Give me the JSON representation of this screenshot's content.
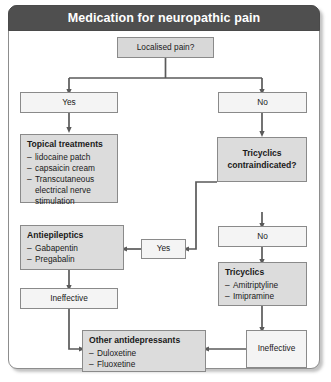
{
  "header": {
    "title": "Medication for neuropathic pain"
  },
  "colors": {
    "header_bg": "#4f4f4f",
    "header_text": "#ffffff",
    "node_shaded": "#dcdcdc",
    "node_plain": "#f4f4f4",
    "border": "#8a8a8a",
    "connector": "#5a5a5a"
  },
  "diagram": {
    "type": "flowchart",
    "nodes": [
      {
        "id": "localised_pain",
        "label": "Localised pain?",
        "kind": "decision"
      },
      {
        "id": "yes_left",
        "label": "Yes",
        "kind": "plain"
      },
      {
        "id": "no_right",
        "label": "No",
        "kind": "plain"
      },
      {
        "id": "topical",
        "label": "Topical treatments",
        "kind": "list",
        "items": [
          "lidocaine patch",
          "capsaicin cream",
          "Transcutaneous\nelectrical nerve\nstimulation"
        ]
      },
      {
        "id": "tricyclics_ci",
        "label": "Tricyclics\ncontraindicated?",
        "kind": "shaded"
      },
      {
        "id": "yes_mid",
        "label": "Yes",
        "kind": "plain"
      },
      {
        "id": "no_mid",
        "label": "No",
        "kind": "plain"
      },
      {
        "id": "antiepileptics",
        "label": "Antiepileptics",
        "kind": "list",
        "items": [
          "Gabapentin",
          "Pregabalin"
        ]
      },
      {
        "id": "tricyclics",
        "label": "Tricyclics",
        "kind": "list",
        "items": [
          "Amitriptyline",
          "Imipramine"
        ]
      },
      {
        "id": "ineffective_left",
        "label": "Ineffective",
        "kind": "plain"
      },
      {
        "id": "ineffective_right",
        "label": "Ineffective",
        "kind": "plain"
      },
      {
        "id": "other_antidep",
        "label": "Other antidepressants",
        "kind": "list",
        "items": [
          "Duloxetine",
          "Fluoxetine"
        ]
      }
    ],
    "edges": [
      {
        "from": "localised_pain",
        "to": "yes_left"
      },
      {
        "from": "localised_pain",
        "to": "no_right"
      },
      {
        "from": "yes_left",
        "to": "topical"
      },
      {
        "from": "no_right",
        "to": "tricyclics_ci"
      },
      {
        "from": "tricyclics_ci",
        "to": "yes_mid"
      },
      {
        "from": "tricyclics_ci",
        "to": "no_mid"
      },
      {
        "from": "yes_mid",
        "to": "antiepileptics"
      },
      {
        "from": "no_mid",
        "to": "tricyclics"
      },
      {
        "from": "antiepileptics",
        "to": "ineffective_left"
      },
      {
        "from": "tricyclics",
        "to": "ineffective_right"
      },
      {
        "from": "ineffective_left",
        "to": "other_antidep"
      },
      {
        "from": "ineffective_right",
        "to": "other_antidep"
      }
    ]
  },
  "nodes_text": {
    "localised_pain": "Localised pain?",
    "yes_left": "Yes",
    "no_right": "No",
    "topical_head": "Topical treatments",
    "topical_i0": "lidocaine patch",
    "topical_i1": "capsaicin cream",
    "topical_i2": "Transcutaneous\nelectrical nerve\nstimulation",
    "tricyclics_ci": "Tricyclics\ncontraindicated?",
    "yes_mid": "Yes",
    "no_mid": "No",
    "antiepileptics_head": "Antiepileptics",
    "antiepileptics_i0": "Gabapentin",
    "antiepileptics_i1": "Pregabalin",
    "tricyclics_head": "Tricyclics",
    "tricyclics_i0": "Amitriptyline",
    "tricyclics_i1": "Imipramine",
    "ineffective_left": "Ineffective",
    "ineffective_right": "Ineffective",
    "other_head": "Other antidepressants",
    "other_i0": "Duloxetine",
    "other_i1": "Fluoxetine",
    "dash": "–"
  }
}
